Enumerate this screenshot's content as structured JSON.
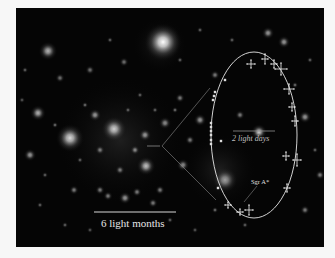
{
  "image": {
    "description": "Infrared image of stars near the Galactic center with an inset showing the elliptical orbit of a star around Sgr A*",
    "background_color": "#050505",
    "frame_color": "#f7f7f7"
  },
  "annotations": {
    "main_scale_bar": {
      "label": "6 light months",
      "color": "#d8d8d8"
    },
    "inset_scale_bar": {
      "label": "2 light days",
      "color": "#9a9a9a"
    },
    "center_label": "Sgr A*",
    "orbit": {
      "shape": "ellipse",
      "color": "#e8e8e8"
    }
  },
  "stars": [
    {
      "x": 163,
      "y": 42,
      "r": 12,
      "b": 1.0
    },
    {
      "x": 70,
      "y": 138,
      "r": 9,
      "b": 0.85
    },
    {
      "x": 114,
      "y": 129,
      "r": 8,
      "b": 0.8
    },
    {
      "x": 48,
      "y": 51,
      "r": 6,
      "b": 0.7
    },
    {
      "x": 146,
      "y": 166,
      "r": 6,
      "b": 0.75
    },
    {
      "x": 38,
      "y": 113,
      "r": 5,
      "b": 0.7
    },
    {
      "x": 225,
      "y": 180,
      "r": 8,
      "b": 0.6
    },
    {
      "x": 259,
      "y": 132,
      "r": 5,
      "b": 0.8
    },
    {
      "x": 284,
      "y": 42,
      "r": 4,
      "b": 0.6
    },
    {
      "x": 268,
      "y": 33,
      "r": 4,
      "b": 0.6
    },
    {
      "x": 30,
      "y": 155,
      "r": 4,
      "b": 0.6
    },
    {
      "x": 95,
      "y": 115,
      "r": 4,
      "b": 0.6
    },
    {
      "x": 125,
      "y": 198,
      "r": 4,
      "b": 0.6
    },
    {
      "x": 165,
      "y": 123,
      "r": 4,
      "b": 0.55
    },
    {
      "x": 200,
      "y": 120,
      "r": 4,
      "b": 0.6
    },
    {
      "x": 183,
      "y": 165,
      "r": 4,
      "b": 0.55
    },
    {
      "x": 305,
      "y": 117,
      "r": 4,
      "b": 0.6
    },
    {
      "x": 145,
      "y": 135,
      "r": 4,
      "b": 0.6
    },
    {
      "x": 240,
      "y": 115,
      "r": 3,
      "b": 0.5
    },
    {
      "x": 153,
      "y": 203,
      "r": 3,
      "b": 0.5
    },
    {
      "x": 108,
      "y": 196,
      "r": 3,
      "b": 0.5
    },
    {
      "x": 100,
      "y": 190,
      "r": 3,
      "b": 0.5
    },
    {
      "x": 137,
      "y": 192,
      "r": 3,
      "b": 0.5
    },
    {
      "x": 215,
      "y": 75,
      "r": 3,
      "b": 0.5
    },
    {
      "x": 74,
      "y": 190,
      "r": 3,
      "b": 0.5
    },
    {
      "x": 60,
      "y": 78,
      "r": 3,
      "b": 0.45
    },
    {
      "x": 90,
      "y": 70,
      "r": 3,
      "b": 0.45
    },
    {
      "x": 124,
      "y": 62,
      "r": 3,
      "b": 0.45
    },
    {
      "x": 180,
      "y": 98,
      "r": 3,
      "b": 0.5
    },
    {
      "x": 190,
      "y": 140,
      "r": 3,
      "b": 0.5
    },
    {
      "x": 320,
      "y": 175,
      "r": 3,
      "b": 0.5
    },
    {
      "x": 305,
      "y": 210,
      "r": 3,
      "b": 0.5
    },
    {
      "x": 135,
      "y": 150,
      "r": 3,
      "b": 0.55
    },
    {
      "x": 120,
      "y": 170,
      "r": 3,
      "b": 0.5
    },
    {
      "x": 160,
      "y": 190,
      "r": 3,
      "b": 0.5
    },
    {
      "x": 100,
      "y": 150,
      "r": 3,
      "b": 0.5
    },
    {
      "x": 85,
      "y": 105,
      "r": 2,
      "b": 0.45
    },
    {
      "x": 55,
      "y": 125,
      "r": 2,
      "b": 0.45
    },
    {
      "x": 25,
      "y": 70,
      "r": 2,
      "b": 0.4
    },
    {
      "x": 200,
      "y": 30,
      "r": 2,
      "b": 0.4
    },
    {
      "x": 232,
      "y": 40,
      "r": 2,
      "b": 0.4
    },
    {
      "x": 295,
      "y": 85,
      "r": 2,
      "b": 0.45
    },
    {
      "x": 215,
      "y": 210,
      "r": 2,
      "b": 0.45
    },
    {
      "x": 170,
      "y": 220,
      "r": 2,
      "b": 0.4
    },
    {
      "x": 40,
      "y": 205,
      "r": 2,
      "b": 0.4
    },
    {
      "x": 65,
      "y": 225,
      "r": 2,
      "b": 0.4
    },
    {
      "x": 245,
      "y": 225,
      "r": 2,
      "b": 0.4
    },
    {
      "x": 180,
      "y": 60,
      "r": 2,
      "b": 0.4
    },
    {
      "x": 110,
      "y": 40,
      "r": 2,
      "b": 0.4
    },
    {
      "x": 140,
      "y": 95,
      "r": 2,
      "b": 0.4
    },
    {
      "x": 175,
      "y": 110,
      "r": 2,
      "b": 0.45
    },
    {
      "x": 155,
      "y": 110,
      "r": 2,
      "b": 0.4
    },
    {
      "x": 128,
      "y": 110,
      "r": 2,
      "b": 0.4
    },
    {
      "x": 80,
      "y": 160,
      "r": 2,
      "b": 0.4
    },
    {
      "x": 45,
      "y": 175,
      "r": 2,
      "b": 0.4
    },
    {
      "x": 90,
      "y": 230,
      "r": 2,
      "b": 0.35
    },
    {
      "x": 195,
      "y": 230,
      "r": 2,
      "b": 0.35
    },
    {
      "x": 310,
      "y": 60,
      "r": 2,
      "b": 0.4
    },
    {
      "x": 315,
      "y": 150,
      "r": 2,
      "b": 0.4
    },
    {
      "x": 22,
      "y": 100,
      "r": 2,
      "b": 0.35
    }
  ],
  "data_points": [
    {
      "x": 251,
      "y": 64,
      "ex": 4,
      "ey": 4
    },
    {
      "x": 265,
      "y": 59,
      "ex": 3,
      "ey": 5
    },
    {
      "x": 274,
      "y": 64,
      "ex": 3,
      "ey": 4
    },
    {
      "x": 281,
      "y": 69,
      "ex": 6,
      "ey": 6
    },
    {
      "x": 289,
      "y": 89,
      "ex": 5,
      "ey": 5
    },
    {
      "x": 292,
      "y": 107,
      "ex": 3,
      "ey": 4
    },
    {
      "x": 295,
      "y": 121,
      "ex": 3,
      "ey": 5
    },
    {
      "x": 286,
      "y": 156,
      "ex": 3,
      "ey": 4
    },
    {
      "x": 297,
      "y": 160,
      "ex": 4,
      "ey": 6
    },
    {
      "x": 287,
      "y": 188,
      "ex": 3,
      "ey": 4
    },
    {
      "x": 249,
      "y": 210,
      "ex": 4,
      "ey": 5
    },
    {
      "x": 240,
      "y": 212,
      "ex": 3,
      "ey": 3
    },
    {
      "x": 228,
      "y": 205,
      "ex": 3,
      "ey": 3
    }
  ],
  "dense_points": [
    {
      "x": 225,
      "y": 80
    },
    {
      "x": 215,
      "y": 92
    },
    {
      "x": 214,
      "y": 96
    },
    {
      "x": 213,
      "y": 100
    },
    {
      "x": 211,
      "y": 123
    },
    {
      "x": 211,
      "y": 127
    },
    {
      "x": 211,
      "y": 131
    },
    {
      "x": 211,
      "y": 135
    },
    {
      "x": 211,
      "y": 140
    },
    {
      "x": 211,
      "y": 144
    },
    {
      "x": 218,
      "y": 188
    },
    {
      "x": 221,
      "y": 141
    }
  ]
}
